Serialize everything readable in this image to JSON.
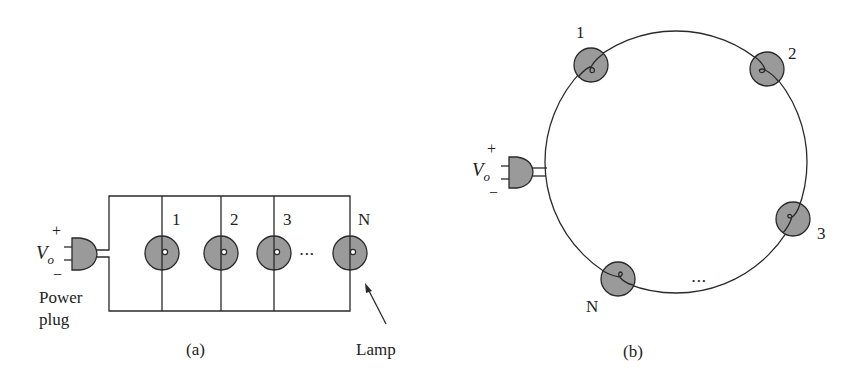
{
  "diagram_a": {
    "caption": "(a)",
    "source_symbol": "V",
    "source_subscript": "o",
    "plus": "+",
    "minus": "−",
    "plug_label_line1": "Power",
    "plug_label_line2": "plug",
    "lamp_labels": [
      "1",
      "2",
      "3",
      "N"
    ],
    "ellipsis": "•••",
    "lamp_callout": "Lamp"
  },
  "diagram_b": {
    "caption": "(b)",
    "source_symbol": "V",
    "source_subscript": "o",
    "plus": "+",
    "minus": "−",
    "lamp_labels": [
      "1",
      "2",
      "3",
      "N"
    ],
    "ellipsis": "•••"
  },
  "colors": {
    "lamp_fill": "#9a9a9a",
    "line": "#2a2a2a",
    "background": "#ffffff"
  }
}
